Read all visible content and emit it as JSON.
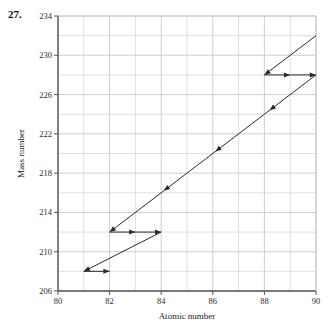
{
  "figure": {
    "problem_number": "27.",
    "background_color": "#ffffff",
    "line_color": "#2a2a2a",
    "grid_color": "#c9c9c9",
    "axis_color": "#555555"
  },
  "chart_data": {
    "type": "line",
    "title": "",
    "subtitle": "",
    "xlabel": "Atomic number",
    "ylabel": "Mass number",
    "xlim": [
      80,
      90
    ],
    "ylim": [
      206,
      234
    ],
    "xticks": [
      80,
      82,
      84,
      86,
      88,
      90
    ],
    "xtick_labels": [
      "80",
      "82",
      "84",
      "86",
      "88",
      "90"
    ],
    "yticks": [
      206,
      210,
      214,
      218,
      222,
      226,
      230,
      234
    ],
    "ytick_labels": [
      "206",
      "210",
      "214",
      "218",
      "222",
      "226",
      "230",
      "234"
    ],
    "x_minor_step": 1,
    "y_minor_step": 2,
    "grid": true,
    "legend": "none",
    "series": [
      {
        "name": "decay-path",
        "comment": "Ordered vertices of the decay staircase from the high-mass parent at (90, 232) down to the final product at (82, 208).",
        "points": [
          {
            "x": 90,
            "y": 232
          },
          {
            "x": 88,
            "y": 228
          },
          {
            "x": 90,
            "y": 228
          },
          {
            "x": 82,
            "y": 212
          },
          {
            "x": 84,
            "y": 212
          },
          {
            "x": 81,
            "y": 208
          },
          {
            "x": 82,
            "y": 208
          }
        ]
      }
    ],
    "segments": [
      {
        "kind": "alpha",
        "label": "alpha-decay-upper",
        "x1": 90,
        "y1": 232,
        "x2": 88,
        "y2": 228,
        "arrow": "end"
      },
      {
        "kind": "beta",
        "label": "beta-decay-228",
        "x1": 88,
        "y1": 228,
        "x2": 90,
        "y2": 228,
        "arrow": "both-mid"
      },
      {
        "kind": "alpha",
        "label": "alpha-decay-long-main",
        "x1": 90,
        "y1": 228,
        "x2": 82,
        "y2": 212,
        "arrow": "end-and-midpoints"
      },
      {
        "kind": "beta",
        "label": "beta-decay-212",
        "x1": 82,
        "y1": 212,
        "x2": 84,
        "y2": 212,
        "arrow": "both-mid"
      },
      {
        "kind": "alpha",
        "label": "alpha-decay-lower",
        "x1": 84,
        "y1": 212,
        "x2": 81,
        "y2": 208,
        "arrow": "end"
      },
      {
        "kind": "beta",
        "label": "beta-decay-208",
        "x1": 81,
        "y1": 208,
        "x2": 82,
        "y2": 208,
        "arrow": "end"
      }
    ],
    "midpoint_markers": [
      {
        "x": 88.2,
        "y": 224.4
      },
      {
        "x": 86.1,
        "y": 220.2
      },
      {
        "x": 84.1,
        "y": 216.2
      }
    ]
  }
}
